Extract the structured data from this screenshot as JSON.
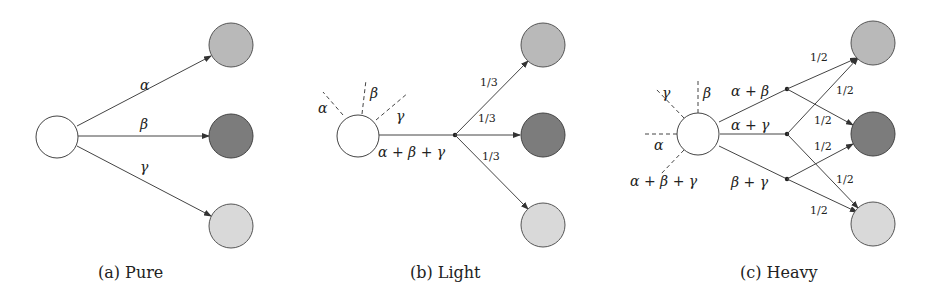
{
  "colors": {
    "source": "#ffffff",
    "target_1": "#b9b9b9",
    "target_2": "#7c7c7c",
    "target_3": "#d9d9d9",
    "stroke": "#444444"
  },
  "panels": [
    {
      "caption": "(a) Pure",
      "edge_labels": [
        "α",
        "β",
        "γ"
      ]
    },
    {
      "caption": "(b) Light",
      "dashed_labels": [
        "α",
        "β",
        "γ"
      ],
      "merged_label": "α + β + γ",
      "split_labels": [
        "1/3",
        "1/3",
        "1/3"
      ]
    },
    {
      "caption": "(c) Heavy",
      "dashed_labels": [
        "γ",
        "β",
        "α",
        "α + β + γ"
      ],
      "merged_labels": [
        "α + β",
        "α + γ",
        "β + γ"
      ],
      "split_labels": [
        "1/2",
        "1/2",
        "1/2",
        "1/2",
        "1/2",
        "1/2"
      ]
    }
  ]
}
